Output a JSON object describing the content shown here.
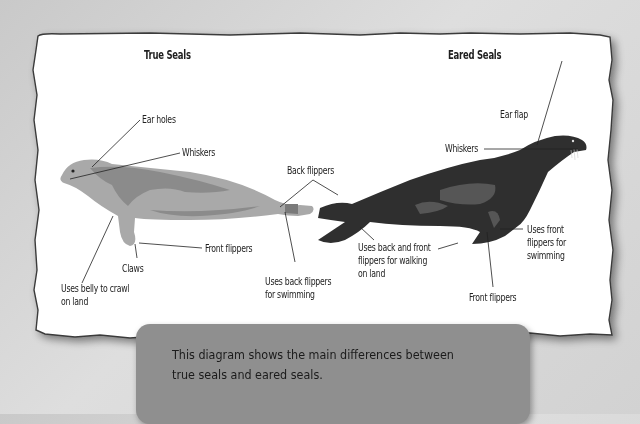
{
  "diagram": {
    "left_section": {
      "title": "True Seals",
      "labels": {
        "ear_holes": "Ear holes",
        "whiskers": "Whiskers",
        "front_flippers": "Front flippers",
        "claws": "Claws",
        "belly": "Uses belly to crawl\non land",
        "belly_line1": "Uses belly to crawl",
        "belly_line2": "on land",
        "back_swim_line1": "Uses back flippers",
        "back_swim_line2": "for swimming"
      }
    },
    "shared": {
      "back_flippers": "Back flippers"
    },
    "right_section": {
      "title": "Eared Seals",
      "labels": {
        "ear_flap": "Ear flap",
        "whiskers": "Whiskers",
        "walk_line1": "Uses back and front",
        "walk_line2": "flippers for walking",
        "walk_line3": "on land",
        "front_swim_line1": "Uses front",
        "front_swim_line2": "flippers for",
        "front_swim_line3": "swimming",
        "front_flippers": "Front flippers"
      }
    }
  },
  "caption": {
    "line1": "This diagram shows the main differences between",
    "line2": "true seals and eared seals."
  },
  "colors": {
    "background": "#d4d4d4",
    "paper": "#ffffff",
    "paper_edge": "#3a3a3a",
    "true_seal_light": "#a8a8a8",
    "true_seal_dark": "#8a8a8a",
    "eared_seal_dark": "#2e2e2e",
    "eared_seal_patch": "#555555",
    "caption_box": "#8f8f8f"
  }
}
